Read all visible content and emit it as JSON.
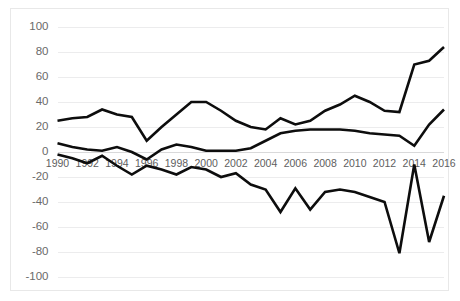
{
  "chart_data": {
    "type": "line",
    "title": "",
    "subtitle": "",
    "xlabel": "",
    "ylabel": "",
    "x": [
      1990,
      1991,
      1992,
      1993,
      1994,
      1995,
      1996,
      1997,
      1998,
      1999,
      2000,
      2001,
      2002,
      2003,
      2004,
      2005,
      2006,
      2007,
      2008,
      2009,
      2010,
      2011,
      2012,
      2013,
      2014,
      2015,
      2016
    ],
    "xlim": [
      1990,
      2016
    ],
    "ylim": [
      -100,
      100
    ],
    "yticks": [
      100,
      80,
      60,
      40,
      20,
      0,
      -20,
      -40,
      -60,
      -80,
      -100
    ],
    "xticks": [
      1990,
      1992,
      1994,
      1996,
      1998,
      2000,
      2002,
      2004,
      2006,
      2008,
      2010,
      2012,
      2014,
      2016
    ],
    "xtick_labels": [
      "1990",
      "1992",
      "1994",
      "1996",
      "1998",
      "2000",
      "2002",
      "2004",
      "2006",
      "2008",
      "2010",
      "2012",
      "2014",
      "2016"
    ],
    "ytick_labels": [
      "100",
      "80",
      "60",
      "40",
      "20",
      "0",
      "-20",
      "-40",
      "-60",
      "-80",
      "-100"
    ],
    "grid": true,
    "legend": "none",
    "series": [
      {
        "name": "upper",
        "color": "#0d0d0d",
        "values": [
          25,
          27,
          28,
          34,
          30,
          28,
          9,
          20,
          30,
          40,
          40,
          33,
          25,
          20,
          18,
          27,
          22,
          25,
          33,
          38,
          45,
          40,
          33,
          32,
          70,
          73,
          84
        ]
      },
      {
        "name": "middle",
        "color": "#0d0d0d",
        "values": [
          7,
          4,
          2,
          1,
          4,
          0,
          -6,
          2,
          6,
          4,
          1,
          1,
          1,
          3,
          9,
          15,
          17,
          18,
          18,
          18,
          17,
          15,
          14,
          13,
          5,
          22,
          34
        ]
      },
      {
        "name": "lower",
        "color": "#0d0d0d",
        "values": [
          -2,
          -5,
          -9,
          -3,
          -11,
          -18,
          -11,
          -14,
          -18,
          -12,
          -14,
          -20,
          -17,
          -26,
          -30,
          -48,
          -29,
          -46,
          -32,
          -30,
          -32,
          -36,
          -40,
          -81,
          -10,
          -72,
          -35
        ]
      }
    ]
  }
}
